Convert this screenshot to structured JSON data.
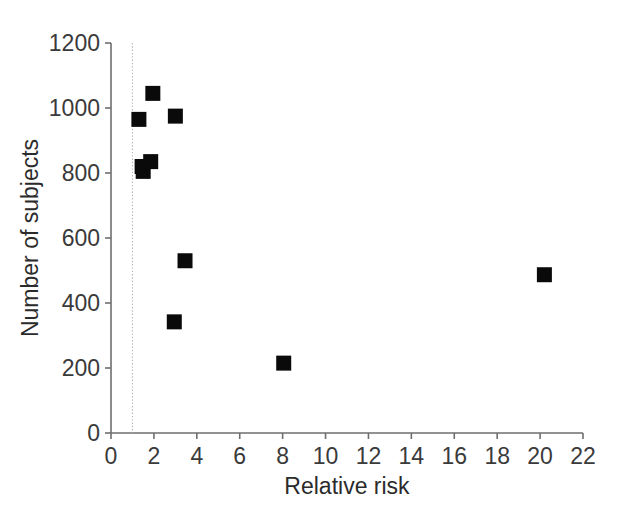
{
  "chart_data": {
    "type": "scatter",
    "title": "",
    "xlabel": "Relative risk",
    "ylabel": "Number of subjects",
    "xlim": [
      0,
      22
    ],
    "ylim": [
      0,
      1200
    ],
    "xticks": [
      0,
      2,
      4,
      6,
      8,
      10,
      12,
      14,
      16,
      18,
      20,
      22
    ],
    "yticks": [
      0,
      200,
      400,
      600,
      800,
      1000,
      1200
    ],
    "xtick_labels": [
      "0",
      "2",
      "4",
      "6",
      "8",
      "10",
      "12",
      "14",
      "16",
      "18",
      "20",
      "22"
    ],
    "ytick_labels": [
      "0",
      "200",
      "400",
      "600",
      "800",
      "1000",
      "1200"
    ],
    "grid": false,
    "legend": "none",
    "marker_shape": "square",
    "marker_color": "#0a0a0a",
    "points": [
      {
        "x": 1.3,
        "y": 965
      },
      {
        "x": 1.95,
        "y": 1045
      },
      {
        "x": 3.0,
        "y": 975
      },
      {
        "x": 1.45,
        "y": 820
      },
      {
        "x": 1.5,
        "y": 805
      },
      {
        "x": 1.85,
        "y": 835
      },
      {
        "x": 3.45,
        "y": 530
      },
      {
        "x": 2.95,
        "y": 342
      },
      {
        "x": 8.05,
        "y": 215
      },
      {
        "x": 20.2,
        "y": 487
      }
    ],
    "annotations": [
      {
        "type": "vertical-reference-line",
        "x": 1.0,
        "style": "dotted",
        "color": "#b8b8b8",
        "label": ""
      }
    ]
  }
}
